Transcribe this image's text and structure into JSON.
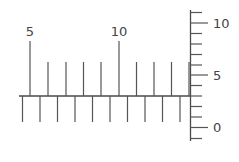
{
  "diagram": {
    "colors": {
      "line": "#4a4a4a",
      "tick": "#555555",
      "text": "#444444",
      "background": "#ffffff"
    },
    "horizontal_ruler": {
      "baseline": {
        "x1": 19,
        "x2": 190,
        "y": 96
      },
      "upper_ticks": {
        "values": [
          5,
          6,
          7,
          8,
          9,
          10,
          11,
          12,
          13,
          14
        ],
        "x": [
          30,
          48,
          66,
          83.5,
          101,
          119,
          136.5,
          154,
          171.5,
          189
        ],
        "major_top_y": 41,
        "minor_top_y": 62,
        "bottom_y": 96,
        "labels": [
          {
            "text": "5",
            "x": 30,
            "y": 36
          },
          {
            "text": "10",
            "x": 119,
            "y": 36
          }
        ]
      },
      "lower_ticks": {
        "count": 10,
        "x": [
          22.5,
          40,
          57.5,
          75,
          92.5,
          110,
          127.5,
          145,
          162.5,
          180
        ],
        "top_y": 96,
        "bottom_y": 122
      }
    },
    "vertical_ruler": {
      "axis": {
        "x": 190.5,
        "y1": 10,
        "y2": 141
      },
      "ticks": {
        "values": [
          11,
          10,
          9,
          8,
          7,
          6,
          5,
          4,
          3,
          2,
          1,
          0,
          -1
        ],
        "y": [
          12.5,
          23,
          33.5,
          44,
          54.5,
          65,
          75,
          85.5,
          96,
          106.5,
          117,
          127.5,
          138.5
        ],
        "major_end_x": 208,
        "minor_end_x": 202
      },
      "labels": [
        {
          "text": "10",
          "x": 213,
          "y": 27.5
        },
        {
          "text": "5",
          "x": 213,
          "y": 80
        },
        {
          "text": "0",
          "x": 213,
          "y": 132
        }
      ]
    }
  }
}
